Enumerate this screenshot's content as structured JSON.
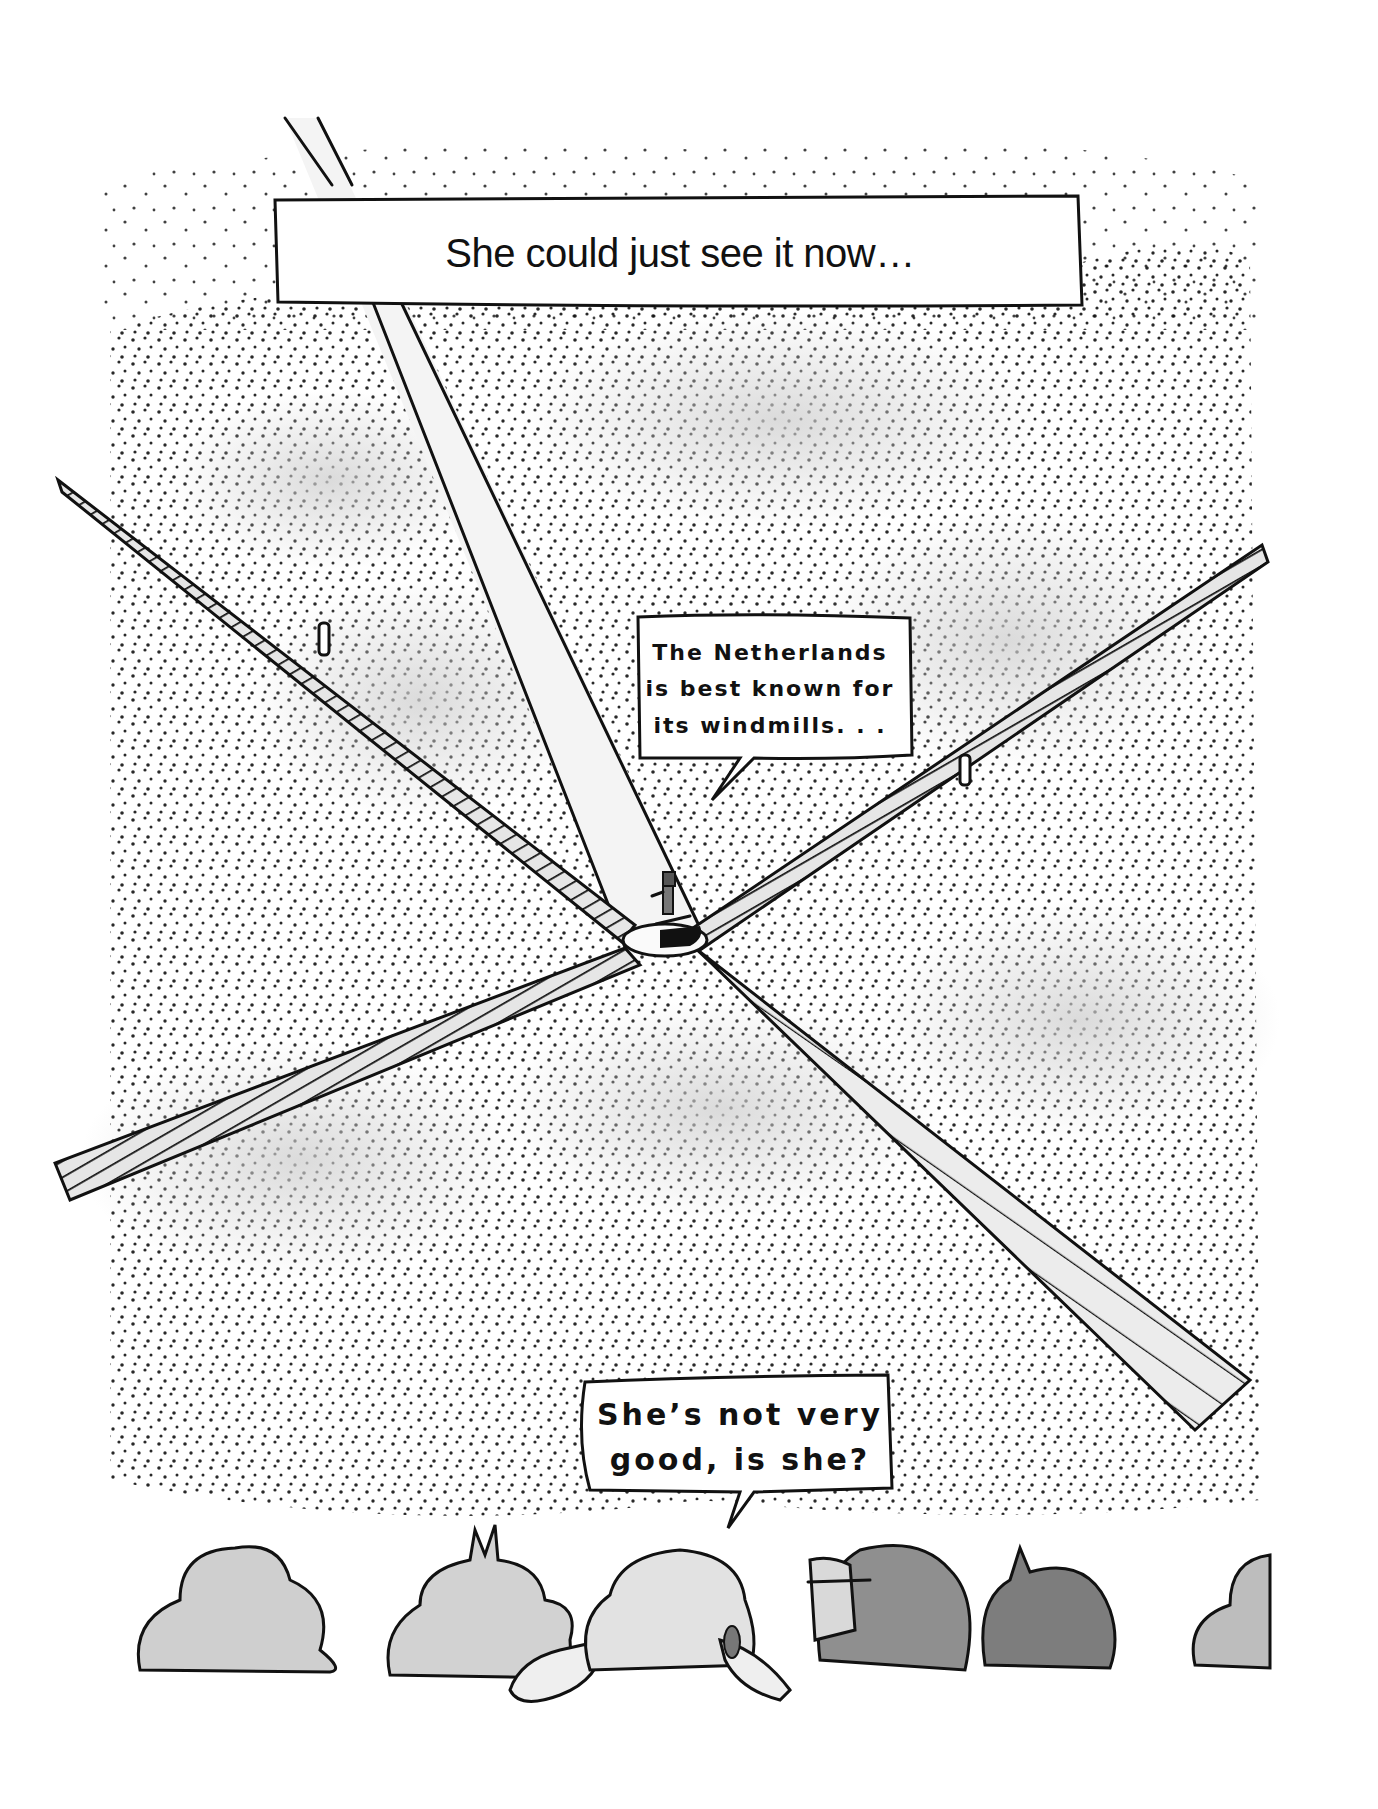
{
  "comic": {
    "caption": "She could just see it now…",
    "bubble_top": {
      "lines": [
        "The Netherlands",
        "is best known for",
        "its windmills. . ."
      ]
    },
    "bubble_bottom": {
      "lines": [
        "She’s not very",
        "good, is she?"
      ]
    }
  },
  "scene": {
    "subject": "aerial view of windmill with four sails",
    "figures": [
      "speaker-on-hub",
      "figure-on-left-sail",
      "figure-on-right-sail"
    ],
    "audience_heads": 7
  },
  "colors": {
    "ink": "#111111",
    "paper": "#ffffff",
    "wash_light": "#d9d9d9",
    "wash_mid": "#c4c4c4",
    "wash_dark": "#8e8e8e",
    "beam": "#f2f2f2"
  }
}
